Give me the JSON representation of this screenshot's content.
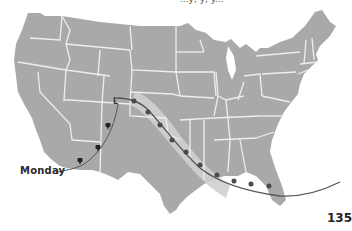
{
  "figure": {
    "type": "weather-map",
    "region": "Continental United States",
    "top_caption_cut": "...y, y, y...",
    "labels": {
      "front_day": "Monday",
      "pressure_center": "L"
    },
    "page_number": "135",
    "symbols": [
      {
        "name": "thunderstorm-icon",
        "count": 3
      },
      {
        "name": "cold-front-marker",
        "count": 8
      },
      {
        "name": "low-pressure-marker",
        "count": 1
      }
    ],
    "colors": {
      "land": "#a9a9a9",
      "state_borders": "#eeeeee",
      "shaded_band": "#cfcfcf",
      "front_line": "#555555",
      "front_markers": "#4a4a4a",
      "background": "#ffffff"
    }
  }
}
